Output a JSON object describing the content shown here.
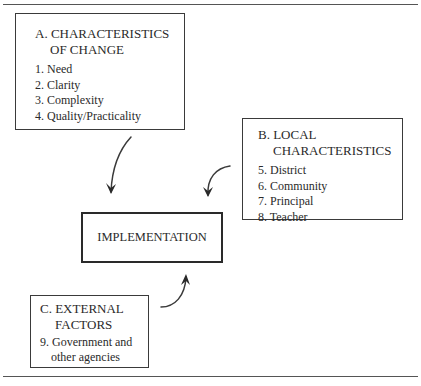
{
  "diagram": {
    "box_a": {
      "heading_line1": "A. CHARACTERISTICS",
      "heading_line2": "OF CHANGE",
      "items": [
        "1. Need",
        "2. Clarity",
        "3. Complexity",
        "4. Quality/Practicality"
      ]
    },
    "box_b": {
      "heading_line1": "B. LOCAL",
      "heading_line2": "CHARACTERISTICS",
      "items": [
        "5. District",
        "6. Community",
        "7. Principal",
        "8. Teacher"
      ]
    },
    "box_c": {
      "heading_line1": "C. EXTERNAL",
      "heading_line2": "FACTORS",
      "item_line1": "9. Government and",
      "item_line2": "other agencies"
    },
    "center_box": {
      "label": "IMPLEMENTATION"
    },
    "arrows": [
      {
        "from": "A. CHARACTERISTICS OF CHANGE",
        "to": "IMPLEMENTATION"
      },
      {
        "from": "B. LOCAL CHARACTERISTICS",
        "to": "IMPLEMENTATION"
      },
      {
        "from": "C. EXTERNAL FACTORS",
        "to": "IMPLEMENTATION"
      }
    ]
  }
}
